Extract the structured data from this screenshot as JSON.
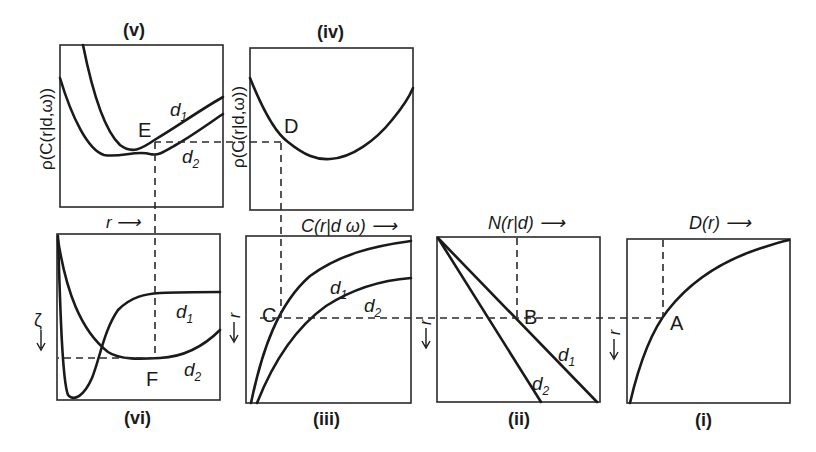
{
  "figure": {
    "panels": [
      {
        "id": "v",
        "title": "(v)",
        "ylabel": "ρ(C(r|d,ω))",
        "xlabel": "r ⟶",
        "point": "E",
        "curves": [
          "d1",
          "d2"
        ]
      },
      {
        "id": "iv",
        "title": "(iv)",
        "ylabel": "ρ(C(r|d,ω))",
        "xlabel": "C(r|d ω) ⟶",
        "point": "D",
        "curves": []
      },
      {
        "id": "vi",
        "title": "(vi)",
        "ylabel": "ζ ⟶",
        "xlabel": "",
        "point": "F",
        "curves": [
          "d1",
          "d2"
        ]
      },
      {
        "id": "iii",
        "title": "(iii)",
        "ylabel": "r ⟶",
        "xlabel": "C(r|d ω) ⟶",
        "point": "C",
        "curves": [
          "d1",
          "d2"
        ]
      },
      {
        "id": "ii",
        "title": "(ii)",
        "ylabel": "r ⟶",
        "xlabel": "N(r|d) ⟶",
        "point": "B",
        "curves": [
          "d1",
          "d2"
        ]
      },
      {
        "id": "i",
        "title": "(i)",
        "ylabel": "r ⟶",
        "xlabel": "D(r) ⟶",
        "point": "A",
        "curves": []
      }
    ],
    "labels": {
      "v_title": "(v)",
      "iv_title": "(iv)",
      "vi_title": "(vi)",
      "iii_title": "(iii)",
      "ii_title": "(ii)",
      "i_title": "(i)",
      "rho_label": "ρ(C(r|d,ω))",
      "r_arrow": "r ⟶",
      "C_label": "C(r|d ω) ⟶",
      "N_label": "N(r|d) ⟶",
      "D_label": "D(r) ⟶",
      "r_down": "r",
      "zeta": "ζ",
      "d": "d",
      "sub1": "1",
      "sub2": "2",
      "A": "A",
      "B": "B",
      "C": "C",
      "D": "D",
      "E": "E",
      "F": "F"
    }
  }
}
